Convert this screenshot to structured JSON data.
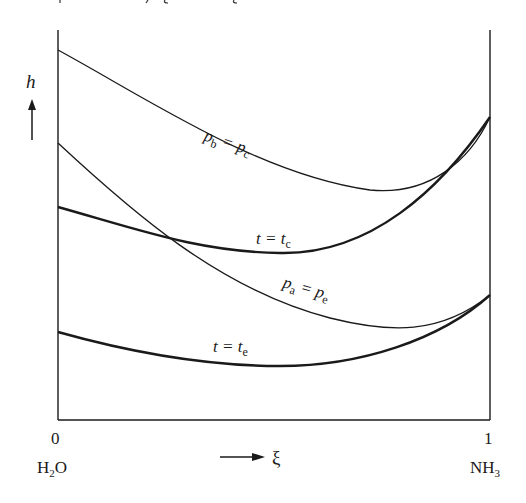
{
  "top_fragment": "p_a, ξ and ξ",
  "axes": {
    "y_label": "h",
    "x_label": "ξ",
    "x_left_tick": "0",
    "x_right_tick": "1",
    "x_left_species": "H",
    "x_left_species_sub": "2",
    "x_left_species_tail": "O",
    "x_right_species": "NH",
    "x_right_species_sub": "3"
  },
  "curves": [
    {
      "id": "pb-pc",
      "label_main": "p",
      "label_sub1": "b",
      "label_eq": " = p",
      "label_sub2": "c",
      "style": "thin"
    },
    {
      "id": "t-tc",
      "label_main": "t = t",
      "label_sub": "c",
      "style": "thick"
    },
    {
      "id": "pa-pe",
      "label_main": "p",
      "label_sub1": "a",
      "label_eq": " = p",
      "label_sub2": "e",
      "style": "thin"
    },
    {
      "id": "t-te",
      "label_main": "t = t",
      "label_sub": "e",
      "style": "thick"
    }
  ],
  "colors": {
    "ink": "#1a1a1a",
    "background": "#ffffff"
  }
}
